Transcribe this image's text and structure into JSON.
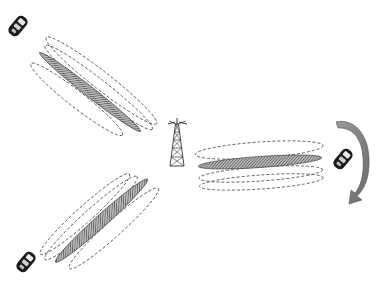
{
  "diagram": {
    "title": "Base station beamforming toward mobile users",
    "colors": {
      "background": "#ffffff",
      "dashed_beam_stroke": "#555555",
      "active_beam_fill": "#8a8a8a",
      "active_beam_stroke": "#444444",
      "tower_stroke": "#333333",
      "phone_body": "#1a1a1a",
      "phone_screen": "#e8e8e8",
      "arrow_fill": "#7d7d7d",
      "arrow_stroke": "#555555"
    },
    "nodes": [
      {
        "id": "tower",
        "type": "base-station-tower-icon",
        "label": "Base station"
      },
      {
        "id": "phone_top_left",
        "type": "mobile-phone-icon",
        "label": "User 1"
      },
      {
        "id": "phone_right",
        "type": "mobile-phone-icon",
        "label": "User 2 (moving)"
      },
      {
        "id": "phone_bottom_left",
        "type": "mobile-phone-icon",
        "label": "User 3"
      }
    ],
    "beam_groups": [
      {
        "id": "beam_group_top_left",
        "target": "phone_top_left",
        "candidate_beams": 3,
        "active_beams": 1
      },
      {
        "id": "beam_group_right",
        "target": "phone_right",
        "candidate_beams": 3,
        "active_beams": 1
      },
      {
        "id": "beam_group_bottom_left",
        "target": "phone_bottom_left",
        "candidate_beams": 3,
        "active_beams": 1
      }
    ],
    "annotations": [
      {
        "id": "movement_arrow",
        "type": "curved-arrow-icon",
        "meaning": "User movement (clockwise, downward)"
      }
    ]
  }
}
